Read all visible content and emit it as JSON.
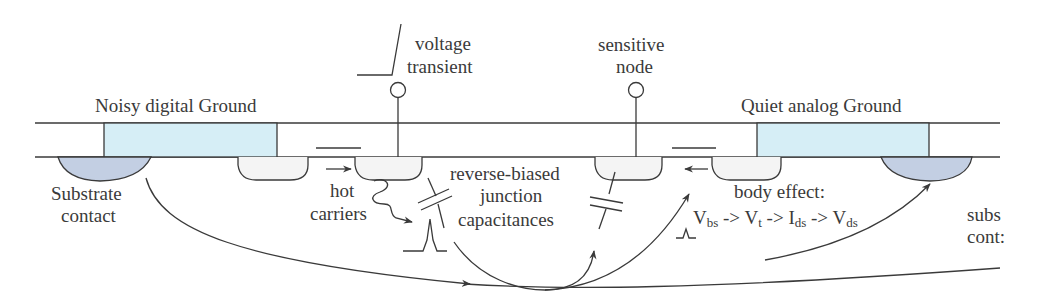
{
  "diagram": {
    "type": "cross-section",
    "colors": {
      "ground_plate": "#d6eef6",
      "substrate_contact": "#c3cfe3",
      "diffusion": "#f4f4f4",
      "line": "#3a3a3a"
    },
    "labels": {
      "noisy_ground": "Noisy digital Ground",
      "quiet_ground": "Quiet analog Ground",
      "substrate_contact_left_1": "Substrate",
      "substrate_contact_left_2": "contact",
      "substrate_contact_right_1": "subs",
      "substrate_contact_right_2": "cont:",
      "voltage_transient_1": "voltage",
      "voltage_transient_2": "transient",
      "sensitive_node_1": "sensitive",
      "sensitive_node_2": "node",
      "hot_carriers_1": "hot",
      "hot_carriers_2": "carriers",
      "rbjc_1": "reverse-biased",
      "rbjc_2": "junction",
      "rbjc_3": "capacitances",
      "body_effect": "body effect:",
      "chain": {
        "v1": "V",
        "s1": "bs",
        "a1": " -> ",
        "v2": "V",
        "s2": "t",
        "a2": " -> ",
        "v3": "I",
        "s3": "ds",
        "a3": " -> ",
        "v4": "V",
        "s4": "ds"
      }
    }
  }
}
